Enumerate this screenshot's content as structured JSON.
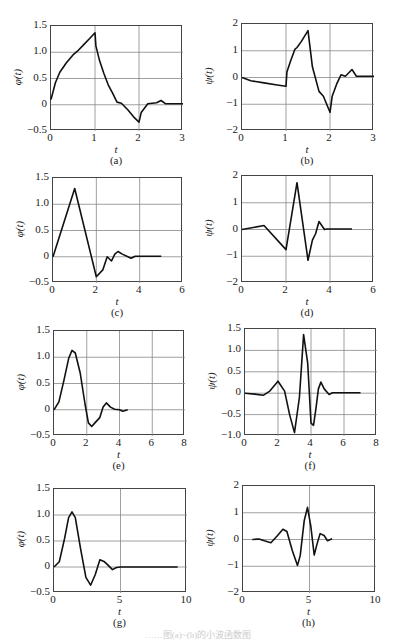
{
  "figure": {
    "footer_text": "……图(a)~(h)的小波函数图"
  },
  "chart_data": [
    {
      "id": "a",
      "type": "line",
      "caption": "(a)",
      "xlabel": "t",
      "ylabel": "φ(t)",
      "xlim": [
        0,
        3
      ],
      "ylim": [
        -0.5,
        1.5
      ],
      "xticks": [
        "0",
        "1",
        "2",
        "3"
      ],
      "yticks": [
        "1.5",
        "1.0",
        "0.5",
        "0",
        "−0.5"
      ],
      "grid": true,
      "x": [
        0,
        0.1,
        0.2,
        0.35,
        0.5,
        0.6,
        0.75,
        0.9,
        1.0,
        1.02,
        1.1,
        1.2,
        1.3,
        1.4,
        1.5,
        1.6,
        1.75,
        1.9,
        2.0,
        2.05,
        2.2,
        2.4,
        2.5,
        2.6,
        3.0
      ],
      "y": [
        0.1,
        0.42,
        0.62,
        0.8,
        0.95,
        1.02,
        1.15,
        1.28,
        1.37,
        1.12,
        0.85,
        0.6,
        0.38,
        0.22,
        0.05,
        0.03,
        -0.1,
        -0.25,
        -0.33,
        -0.15,
        0.02,
        0.04,
        0.08,
        0.02,
        0.02
      ]
    },
    {
      "id": "b",
      "type": "line",
      "caption": "(b)",
      "xlabel": "t",
      "ylabel": "ψ(t)",
      "xlim": [
        0,
        3
      ],
      "ylim": [
        -2,
        2
      ],
      "xticks": [
        "0",
        "1",
        "2",
        "3"
      ],
      "yticks": [
        "2",
        "1",
        "0",
        "−1",
        "−2"
      ],
      "grid": true,
      "x": [
        0,
        0.2,
        0.5,
        0.8,
        1.0,
        1.02,
        1.1,
        1.2,
        1.25,
        1.35,
        1.5,
        1.6,
        1.75,
        1.85,
        2.0,
        2.05,
        2.15,
        2.25,
        2.35,
        2.5,
        2.6,
        3.0
      ],
      "y": [
        0.0,
        -0.12,
        -0.2,
        -0.28,
        -0.33,
        0.2,
        0.6,
        1.05,
        1.12,
        1.35,
        1.75,
        0.4,
        -0.52,
        -0.7,
        -1.3,
        -0.7,
        -0.25,
        0.1,
        0.05,
        0.3,
        0.05,
        0.05
      ]
    },
    {
      "id": "c",
      "type": "line",
      "caption": "(c)",
      "xlabel": "t",
      "ylabel": "φ(t)",
      "xlim": [
        0,
        6
      ],
      "ylim": [
        -0.5,
        1.5
      ],
      "xticks": [
        "0",
        "2",
        "4",
        "6"
      ],
      "yticks": [
        "1.5",
        "1.0",
        "0.5",
        "0",
        "−0.5"
      ],
      "grid": true,
      "x": [
        0,
        1.0,
        2.0,
        2.3,
        2.5,
        2.7,
        2.85,
        3.0,
        3.2,
        3.6,
        3.8,
        4.0,
        5.0
      ],
      "y": [
        0.0,
        1.3,
        -0.38,
        -0.25,
        0.0,
        -0.08,
        0.05,
        0.1,
        0.05,
        -0.03,
        0.01,
        0.01,
        0.01
      ]
    },
    {
      "id": "d",
      "type": "line",
      "caption": "(d)",
      "xlabel": "t",
      "ylabel": "ψ(t)",
      "xlim": [
        0,
        6
      ],
      "ylim": [
        -2,
        2
      ],
      "xticks": [
        "0",
        "2",
        "4",
        "6"
      ],
      "yticks": [
        "2",
        "1",
        "0",
        "−1",
        "−2"
      ],
      "grid": true,
      "x": [
        0,
        1.0,
        2.0,
        2.5,
        3.0,
        3.2,
        3.35,
        3.5,
        3.75,
        3.85,
        5.0
      ],
      "y": [
        0.0,
        0.15,
        -0.75,
        1.75,
        -1.15,
        -0.4,
        -0.15,
        0.3,
        0.0,
        0.02,
        0.02
      ]
    },
    {
      "id": "e",
      "type": "line",
      "caption": "(e)",
      "xlabel": "t",
      "ylabel": "φ(t)",
      "xlim": [
        0,
        8
      ],
      "ylim": [
        -0.5,
        1.5
      ],
      "xticks": [
        "0",
        "2",
        "4",
        "6",
        "8"
      ],
      "yticks": [
        "1.5",
        "1.0",
        "0.5",
        "0",
        "−0.5"
      ],
      "grid": true,
      "x": [
        0,
        0.3,
        0.6,
        0.9,
        1.1,
        1.3,
        1.6,
        1.9,
        2.1,
        2.3,
        2.5,
        2.8,
        3.0,
        3.2,
        3.45,
        3.7,
        4.0,
        4.2,
        4.5
      ],
      "y": [
        0.0,
        0.15,
        0.55,
        0.98,
        1.13,
        1.08,
        0.7,
        0.1,
        -0.25,
        -0.32,
        -0.25,
        -0.15,
        0.05,
        0.13,
        0.05,
        0.01,
        0.0,
        -0.03,
        0.0
      ]
    },
    {
      "id": "f",
      "type": "line",
      "caption": "(f)",
      "xlabel": "t",
      "ylabel": "ψ(t)",
      "xlim": [
        0,
        8
      ],
      "ylim": [
        -1.0,
        1.5
      ],
      "xticks": [
        "0",
        "2",
        "4",
        "6",
        "8"
      ],
      "yticks": [
        "1.5",
        "1.0",
        "0.5",
        "0",
        "−0.5",
        "−1.0"
      ],
      "grid": true,
      "x": [
        0,
        0.6,
        1.1,
        1.5,
        2.0,
        2.4,
        2.7,
        3.0,
        3.3,
        3.55,
        3.8,
        4.0,
        4.15,
        4.3,
        4.45,
        4.6,
        4.8,
        5.1,
        5.3,
        7.0
      ],
      "y": [
        0.0,
        -0.02,
        -0.05,
        0.05,
        0.28,
        0.05,
        -0.5,
        -0.92,
        -0.1,
        1.37,
        0.7,
        -0.7,
        -0.75,
        -0.35,
        0.1,
        0.26,
        0.1,
        -0.03,
        0.01,
        0.01
      ]
    },
    {
      "id": "g",
      "type": "line",
      "caption": "(g)",
      "xlabel": "t",
      "ylabel": "φ(t)",
      "xlim": [
        0,
        10
      ],
      "ylim": [
        -0.5,
        1.5
      ],
      "xticks": [
        "0",
        "5",
        "10"
      ],
      "yticks": [
        "1.5",
        "1.0",
        "0.5",
        "0",
        "−0.5"
      ],
      "grid": true,
      "x": [
        0,
        0.4,
        0.8,
        1.1,
        1.35,
        1.6,
        2.0,
        2.4,
        2.75,
        3.1,
        3.45,
        3.8,
        4.0,
        4.4,
        4.7,
        5.0,
        9.3
      ],
      "y": [
        0.0,
        0.1,
        0.55,
        0.95,
        1.06,
        0.95,
        0.35,
        -0.2,
        -0.35,
        -0.15,
        0.14,
        0.1,
        0.05,
        -0.05,
        -0.01,
        0.0,
        0.0
      ]
    },
    {
      "id": "h",
      "type": "line",
      "caption": "(h)",
      "xlabel": "t",
      "ylabel": "ψ(t)",
      "xlim": [
        0,
        10
      ],
      "ylim": [
        -2,
        2
      ],
      "xticks": [
        "0",
        "5",
        "10"
      ],
      "yticks": [
        "2",
        "1",
        "0",
        "−1",
        "−2"
      ],
      "grid": true,
      "x": [
        0.7,
        1.2,
        1.6,
        2.1,
        2.6,
        3.0,
        3.3,
        3.7,
        4.1,
        4.3,
        4.6,
        4.85,
        5.1,
        5.35,
        5.55,
        5.8,
        6.1,
        6.35,
        6.7
      ],
      "y": [
        0.0,
        0.02,
        -0.05,
        -0.12,
        0.15,
        0.38,
        0.3,
        -0.4,
        -0.97,
        -0.6,
        0.7,
        1.2,
        0.5,
        -0.58,
        -0.2,
        0.22,
        0.15,
        -0.05,
        0.03
      ]
    }
  ]
}
